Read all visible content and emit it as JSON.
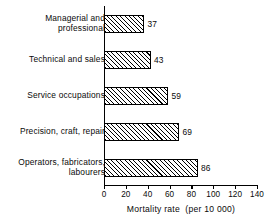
{
  "chart_data": {
    "type": "bar",
    "orientation": "horizontal",
    "title": "",
    "xlabel": "Mortality rate  (per 10 000)",
    "ylabel": "",
    "xlim": [
      0,
      140
    ],
    "xticks": [
      0,
      20,
      40,
      60,
      80,
      100,
      120,
      140
    ],
    "xtick_labels": [
      "0",
      "20",
      "40",
      "60",
      "80",
      "100",
      "120",
      "140"
    ],
    "grid": false,
    "legend": null,
    "categories": [
      "Managerial and\nprofessional",
      "Technical and sales",
      "Service occupations",
      "Precision, craft, repair",
      "Operators, fabricators,\nlabourers"
    ],
    "values": [
      37,
      43,
      59,
      69,
      86
    ],
    "data_labels": [
      "37",
      "43",
      "59",
      "69",
      "86"
    ],
    "bar_style": {
      "fill": "#ffffff",
      "hatch": "diagonal-forward-slash",
      "hatch_color": "#000000",
      "edge_color": "#000000"
    },
    "axis_color": "#000000",
    "background": "#ffffff"
  },
  "bars": [
    {
      "category": "Managerial and\nprofessional",
      "value": 37,
      "label": "37"
    },
    {
      "category": "Technical and sales",
      "value": 43,
      "label": "43"
    },
    {
      "category": "Service occupations",
      "value": 59,
      "label": "59"
    },
    {
      "category": "Precision, craft, repair",
      "value": 69,
      "label": "69"
    },
    {
      "category": "Operators, fabricators,\nlabourers",
      "value": 86,
      "label": "86"
    }
  ],
  "axis": {
    "x_title": "Mortality rate  (per 10 000)",
    "ticks": [
      "0",
      "20",
      "40",
      "60",
      "80",
      "100",
      "120",
      "140"
    ]
  }
}
